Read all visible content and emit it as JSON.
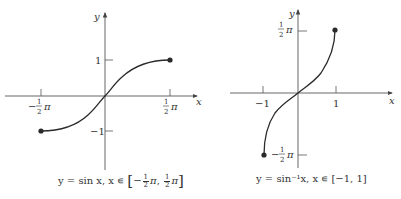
{
  "figures": [
    {
      "id": "sin",
      "function": "y = sin x",
      "x_axis_label": "x",
      "y_axis_label": "y",
      "x_ticks": [
        {
          "value": "-π/2",
          "num": "1",
          "den": "2",
          "sign": "−",
          "sym": "π"
        },
        {
          "value": "π/2",
          "num": "1",
          "den": "2",
          "sign": "",
          "sym": "π"
        }
      ],
      "y_ticks": [
        {
          "value": 1,
          "label": "1"
        },
        {
          "value": -1,
          "label": "−1"
        }
      ],
      "endpoints": [
        {
          "x": "-π/2",
          "y": -1
        },
        {
          "x": "π/2",
          "y": 1
        }
      ],
      "caption": {
        "prefix": "y = sin x, x ∊ ",
        "open_bracket": "[",
        "close_bracket": "]",
        "lower": {
          "sign": "−",
          "num": "1",
          "den": "2",
          "sym": "π"
        },
        "sep": ", ",
        "upper": {
          "sign": "",
          "num": "1",
          "den": "2",
          "sym": "π"
        }
      }
    },
    {
      "id": "arcsin",
      "function": "y = sin⁻¹x",
      "x_axis_label": "x",
      "y_axis_label": "y",
      "x_ticks": [
        {
          "value": -1,
          "label": "−1"
        },
        {
          "value": 1,
          "label": "1"
        }
      ],
      "y_ticks": [
        {
          "value": "π/2",
          "num": "1",
          "den": "2",
          "sign": "",
          "sym": "π"
        },
        {
          "value": "-π/2",
          "num": "1",
          "den": "2",
          "sign": "−",
          "sym": "π"
        }
      ],
      "endpoints": [
        {
          "x": -1,
          "y": "-π/2"
        },
        {
          "x": 1,
          "y": "π/2"
        }
      ],
      "caption": {
        "text": "y = sin⁻¹x,  x ∊ [−1, 1]"
      }
    }
  ],
  "colors": {
    "curve": "#2a2a2a",
    "axis": "#555555",
    "text": "#333333"
  }
}
